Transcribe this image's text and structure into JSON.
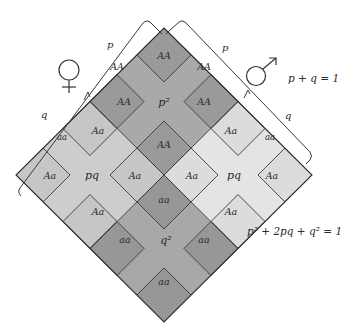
{
  "diagram": {
    "female": {
      "symbol": "venus-symbol",
      "allele_labels": {
        "p": "p",
        "q": "q"
      },
      "outer_labels": {
        "p_side": "AA",
        "q_side": "aa"
      }
    },
    "male": {
      "symbol": "mars-symbol",
      "allele_labels": {
        "p": "p",
        "q": "q"
      },
      "outer_labels": {
        "p_side": "AA",
        "q_side": "aa"
      }
    },
    "allele_equation": "p + q = 1",
    "genotype_equation": "p² + 2pq + q² = 1",
    "quadrants": [
      {
        "id": "top",
        "center_label": "p²",
        "color": "#a9a9a9",
        "cell_color": "#9a9a9a",
        "cells": {
          "top": "AA",
          "left": "AA",
          "right": "AA",
          "bottom": "AA"
        }
      },
      {
        "id": "left",
        "center_label": "pq",
        "color": "#cfcfcf",
        "cell_color": "#c4c4c4",
        "cells": {
          "top": "Aa",
          "left": "Aa",
          "right": "Aa",
          "bottom": "Aa"
        }
      },
      {
        "id": "right",
        "center_label": "pq",
        "color": "#e6e6e6",
        "cell_color": "#dedede",
        "cells": {
          "top": "Aa",
          "left": "Aa",
          "right": "Aa",
          "bottom": "Aa"
        }
      },
      {
        "id": "bottom",
        "center_label": "q²",
        "color": "#a6a6a6",
        "cell_color": "#989898",
        "cells": {
          "top": "aa",
          "left": "aa",
          "right": "aa",
          "bottom": "aa"
        }
      }
    ],
    "colors": {
      "outline": "#2e2e2e",
      "text": "#2a2a2a",
      "background": "#ffffff"
    }
  }
}
